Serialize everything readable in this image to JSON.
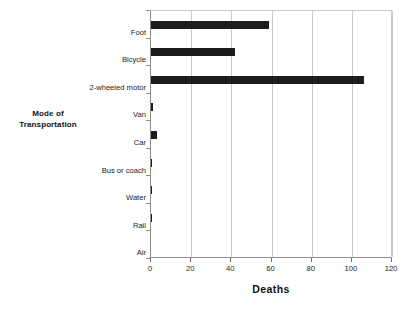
{
  "chart_data": {
    "type": "bar",
    "orientation": "horizontal",
    "title": "",
    "xlabel": "Deaths",
    "ylabel": "Mode of Transportation",
    "ylabel_lines": [
      "Mode of",
      "Transportation"
    ],
    "categories": [
      "Foot",
      "Bicycle",
      "2-wheeled motor",
      "Van",
      "Car",
      "Bus or coach",
      "Water",
      "Rail",
      "Air"
    ],
    "values": [
      59,
      42,
      106,
      1,
      3,
      0.5,
      0.5,
      0.5,
      0
    ],
    "xlim": [
      0,
      120
    ],
    "xticks": [
      0,
      20,
      40,
      60,
      80,
      100,
      120
    ],
    "xtick_labels": [
      "0",
      "20",
      "40",
      "60",
      "80",
      "100",
      "120"
    ],
    "grid": "vertical",
    "legend": "none",
    "bar_color": "#1c1c1c",
    "gridline_color": "#c9c9c9",
    "axis_color": "#8d8d8d"
  }
}
